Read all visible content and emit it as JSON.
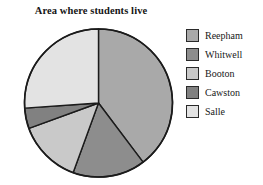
{
  "chart_data": {
    "type": "pie",
    "title": "Area where students live",
    "xlabel": "",
    "ylabel": "",
    "legend_position": "right",
    "grid": false,
    "start_angle_deg": 0,
    "direction": "clockwise",
    "categories": [
      "Reepham",
      "Whitwell",
      "Booton",
      "Cawston",
      "Salle"
    ],
    "values": [
      39.7,
      15.8,
      13.9,
      4.5,
      26.1
    ],
    "units": "percent",
    "slices": [
      {
        "label": "Reepham",
        "value": 39.7,
        "start_angle_deg": 0,
        "end_angle_deg": 143,
        "color": "#a9a9a9"
      },
      {
        "label": "Whitwell",
        "value": 15.8,
        "start_angle_deg": 143,
        "end_angle_deg": 200,
        "color": "#8d8d8d"
      },
      {
        "label": "Booton",
        "value": 13.9,
        "start_angle_deg": 200,
        "end_angle_deg": 250,
        "color": "#c9c9c9"
      },
      {
        "label": "Cawston",
        "value": 4.5,
        "start_angle_deg": 250,
        "end_angle_deg": 266,
        "color": "#818181"
      },
      {
        "label": "Salle",
        "value": 26.1,
        "start_angle_deg": 266,
        "end_angle_deg": 360,
        "color": "#e3e3e3"
      }
    ],
    "geometry": {
      "center_x": 98.5,
      "center_y": 103,
      "radius": 74
    },
    "outline_color": "#1b1b1b"
  },
  "legend": {
    "items": [
      {
        "label": "Reepham",
        "color": "#a9a9a9"
      },
      {
        "label": "Whitwell",
        "color": "#8d8d8d"
      },
      {
        "label": "Booton",
        "color": "#c9c9c9"
      },
      {
        "label": "Cawston",
        "color": "#818181"
      },
      {
        "label": "Salle",
        "color": "#e3e3e3"
      }
    ]
  }
}
